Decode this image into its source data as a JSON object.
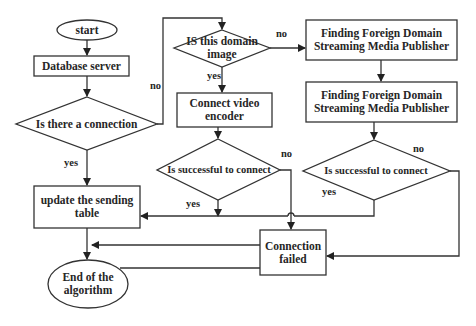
{
  "diagram": {
    "type": "flowchart",
    "nodes": {
      "start": "start",
      "database_server": "Database server",
      "is_connection": "Is there a connection",
      "is_domain_image": "IS this domain image",
      "finding_1": "Finding Foreign Domain Streaming Media Publisher",
      "finding_2": "Finding Foreign Domain Streaming Media Publisher",
      "connect_encoder": "Connect video encoder",
      "success_1": "Is successful to connect",
      "success_2": "Is successful to connect",
      "update_table": "update the sending table",
      "connection_failed": "Connection failed",
      "end": "End of the algorithm"
    },
    "edge_labels": {
      "connection_no": "no",
      "connection_yes": "yes",
      "domain_no": "no",
      "domain_yes": "yes",
      "success1_no": "no",
      "success1_yes": "yes",
      "success2_no": "no",
      "success2_yes": "yes"
    },
    "edges": [
      {
        "from": "start",
        "to": "database_server"
      },
      {
        "from": "database_server",
        "to": "is_connection"
      },
      {
        "from": "is_connection",
        "to": "update_table",
        "label": "yes"
      },
      {
        "from": "is_connection",
        "to": "is_domain_image",
        "label": "no"
      },
      {
        "from": "is_domain_image",
        "to": "connect_encoder",
        "label": "yes"
      },
      {
        "from": "is_domain_image",
        "to": "finding_1",
        "label": "no"
      },
      {
        "from": "finding_1",
        "to": "finding_2"
      },
      {
        "from": "connect_encoder",
        "to": "success_1"
      },
      {
        "from": "success_1",
        "to": "update_table",
        "label": "yes"
      },
      {
        "from": "success_1",
        "to": "connection_failed",
        "label": "no"
      },
      {
        "from": "finding_2",
        "to": "success_2"
      },
      {
        "from": "success_2",
        "to": "update_table",
        "label": "yes"
      },
      {
        "from": "success_2",
        "to": "connection_failed",
        "label": "no"
      },
      {
        "from": "update_table",
        "to": "end"
      },
      {
        "from": "connection_failed",
        "to": "end"
      }
    ]
  }
}
